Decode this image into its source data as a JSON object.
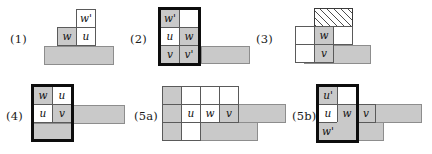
{
  "figure": {
    "colors": {
      "gray_fill": "#c9c9c9",
      "white_fill": "#ffffff",
      "cell_border": "#5a5a5a",
      "thick_border": "#0d0d0d",
      "hatch_line": "#4d4d4d",
      "page_background": "#ffffff"
    },
    "panels": [
      {
        "id": "panel-1",
        "label": "(1)",
        "cells": [
          {
            "name": "cell-w-prime",
            "text": "w'",
            "fill": "white"
          },
          {
            "name": "cell-w",
            "text": "w",
            "fill": "gray"
          },
          {
            "name": "cell-u",
            "text": "u",
            "fill": "white"
          }
        ],
        "slabs": [
          {
            "name": "base-slab",
            "fill": "gray"
          }
        ],
        "has_thick_box": false,
        "has_hatch": false
      },
      {
        "id": "panel-2",
        "label": "(2)",
        "cells": [
          {
            "name": "cell-w-prime",
            "text": "w'",
            "fill": "gray"
          },
          {
            "name": "cell-empty",
            "text": "",
            "fill": "white"
          },
          {
            "name": "cell-u",
            "text": "u",
            "fill": "white"
          },
          {
            "name": "cell-w",
            "text": "w",
            "fill": "gray"
          },
          {
            "name": "cell-v",
            "text": "v",
            "fill": "gray"
          },
          {
            "name": "cell-v-prime",
            "text": "v'",
            "fill": "gray"
          }
        ],
        "slabs": [
          {
            "name": "side-slab",
            "fill": "gray"
          }
        ],
        "has_thick_box": true,
        "has_hatch": false
      },
      {
        "id": "panel-3",
        "label": "(3)",
        "cells": [
          {
            "name": "cell-hatched",
            "text": "",
            "fill": "hatch"
          },
          {
            "name": "cell-left-upper",
            "text": "",
            "fill": "white"
          },
          {
            "name": "cell-w",
            "text": "w",
            "fill": "gray"
          },
          {
            "name": "cell-right-white",
            "text": "",
            "fill": "white"
          },
          {
            "name": "cell-left-lower",
            "text": "",
            "fill": "white"
          },
          {
            "name": "cell-v",
            "text": "v",
            "fill": "gray"
          }
        ],
        "slabs": [
          {
            "name": "base-slab",
            "fill": "gray"
          }
        ],
        "has_thick_box": false,
        "has_hatch": true
      },
      {
        "id": "panel-4",
        "label": "(4)",
        "cells": [
          {
            "name": "cell-w",
            "text": "w",
            "fill": "gray"
          },
          {
            "name": "cell-u-top",
            "text": "u",
            "fill": "white"
          },
          {
            "name": "cell-u-bottom",
            "text": "u",
            "fill": "white"
          },
          {
            "name": "cell-v",
            "text": "v",
            "fill": "gray"
          }
        ],
        "slabs": [
          {
            "name": "box-base-slab",
            "fill": "gray"
          },
          {
            "name": "right-bar-slab",
            "fill": "gray"
          }
        ],
        "has_thick_box": true,
        "has_hatch": false
      },
      {
        "id": "panel-5a",
        "label": "(5a)",
        "cells": [
          {
            "name": "cell-top-left-gray",
            "text": "",
            "fill": "gray"
          },
          {
            "name": "cell-top-mid-white",
            "text": "",
            "fill": "white"
          },
          {
            "name": "cell-top-right-white",
            "text": "",
            "fill": "white"
          },
          {
            "name": "cell-top-far-white",
            "text": "",
            "fill": "white"
          },
          {
            "name": "cell-mid-left-gray",
            "text": "",
            "fill": "gray"
          },
          {
            "name": "cell-u",
            "text": "u",
            "fill": "white"
          },
          {
            "name": "cell-w",
            "text": "w",
            "fill": "white"
          },
          {
            "name": "cell-v",
            "text": "v",
            "fill": "gray"
          },
          {
            "name": "cell-bot-left-gray",
            "text": "",
            "fill": "gray"
          },
          {
            "name": "cell-bot-mid-white",
            "text": "",
            "fill": "white"
          }
        ],
        "slabs": [
          {
            "name": "right-bar-slab",
            "fill": "gray"
          },
          {
            "name": "bottom-slab",
            "fill": "gray"
          }
        ],
        "has_thick_box": false,
        "has_hatch": false
      },
      {
        "id": "panel-5b",
        "label": "(5b)",
        "cells": [
          {
            "name": "cell-u-prime",
            "text": "u'",
            "fill": "gray"
          },
          {
            "name": "cell-empty",
            "text": "",
            "fill": "white"
          },
          {
            "name": "cell-u",
            "text": "u",
            "fill": "white"
          },
          {
            "name": "cell-w",
            "text": "w",
            "fill": "gray"
          },
          {
            "name": "cell-v",
            "text": "v",
            "fill": "gray"
          },
          {
            "name": "cell-w-prime",
            "text": "w'",
            "fill": "gray"
          }
        ],
        "slabs": [
          {
            "name": "right-bar-slab",
            "fill": "gray"
          },
          {
            "name": "lower-right-slab",
            "fill": "gray"
          }
        ],
        "has_thick_box": true,
        "has_hatch": false
      }
    ]
  }
}
